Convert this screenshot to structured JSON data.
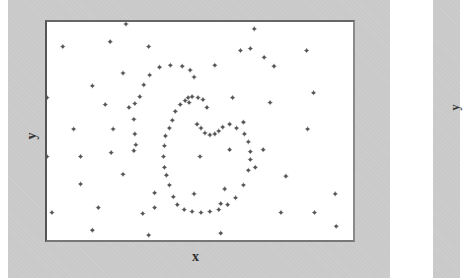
{
  "chart_data": {
    "type": "scatter",
    "title": "",
    "xlabel": "x",
    "ylabel": "y",
    "grid": false,
    "legend": null,
    "xlim": [
      0,
      310
    ],
    "ylim": [
      0,
      222
    ],
    "note": "Points in plot pixel coordinates (origin top-left of plot frame). Spiral of points surrounded by scattered random points.",
    "series": [
      {
        "name": "spiral",
        "points": [
          [
            162,
            87
          ],
          [
            158,
            79
          ],
          [
            153,
            77
          ],
          [
            147,
            76
          ],
          [
            143,
            77
          ],
          [
            140,
            80
          ],
          [
            135,
            84
          ],
          [
            130,
            91
          ],
          [
            127,
            100
          ],
          [
            124,
            108
          ],
          [
            120,
            116
          ],
          [
            119,
            126
          ],
          [
            118,
            137
          ],
          [
            119,
            148
          ],
          [
            121,
            156
          ],
          [
            124,
            166
          ],
          [
            128,
            178
          ],
          [
            132,
            186
          ],
          [
            139,
            191
          ],
          [
            147,
            193
          ],
          [
            156,
            194
          ],
          [
            165,
            193
          ],
          [
            174,
            191
          ],
          [
            183,
            186
          ],
          [
            191,
            179
          ],
          [
            199,
            166
          ],
          [
            204,
            151
          ],
          [
            206,
            140
          ],
          [
            206,
            132
          ],
          [
            204,
            122
          ],
          [
            200,
            114
          ],
          [
            192,
            108
          ],
          [
            185,
            104
          ],
          [
            178,
            107
          ],
          [
            174,
            111
          ],
          [
            170,
            114
          ],
          [
            165,
            115
          ],
          [
            160,
            113
          ],
          [
            156,
            108
          ],
          [
            152,
            104
          ],
          [
            144,
            82
          ],
          [
            149,
            56
          ],
          [
            145,
            49
          ],
          [
            137,
            45
          ],
          [
            125,
            44
          ],
          [
            114,
            46
          ],
          [
            104,
            54
          ],
          [
            98,
            64
          ],
          [
            94,
            76
          ],
          [
            89,
            83
          ],
          [
            88,
            99
          ],
          [
            89,
            114
          ],
          [
            90,
            125
          ],
          [
            88,
            131
          ]
        ]
      },
      {
        "name": "random",
        "points": [
          [
            80,
            2
          ],
          [
            16,
            25
          ],
          [
            64,
            20
          ],
          [
            103,
            25
          ],
          [
            210,
            7
          ],
          [
            196,
            29
          ],
          [
            206,
            27
          ],
          [
            220,
            36
          ],
          [
            77,
            52
          ],
          [
            46,
            65
          ],
          [
            0,
            77
          ],
          [
            59,
            84
          ],
          [
            83,
            87
          ],
          [
            230,
            45
          ],
          [
            170,
            44
          ],
          [
            263,
            29
          ],
          [
            270,
            72
          ],
          [
            188,
            77
          ],
          [
            226,
            82
          ],
          [
            199,
            102
          ],
          [
            264,
            109
          ],
          [
            185,
            130
          ],
          [
            219,
            130
          ],
          [
            155,
            137
          ],
          [
            211,
            148
          ],
          [
            180,
            170
          ],
          [
            292,
            175
          ],
          [
            27,
            109
          ],
          [
            67,
            109
          ],
          [
            0,
            137
          ],
          [
            34,
            137
          ],
          [
            65,
            133
          ],
          [
            77,
            155
          ],
          [
            34,
            165
          ],
          [
            109,
            174
          ],
          [
            149,
            175
          ],
          [
            176,
            185
          ],
          [
            242,
            157
          ],
          [
            237,
            194
          ],
          [
            271,
            194
          ],
          [
            293,
            208
          ],
          [
            176,
            215
          ],
          [
            52,
            189
          ],
          [
            109,
            189
          ],
          [
            103,
            217
          ],
          [
            97,
            195
          ],
          [
            5,
            194
          ],
          [
            46,
            212
          ]
        ]
      }
    ]
  }
}
